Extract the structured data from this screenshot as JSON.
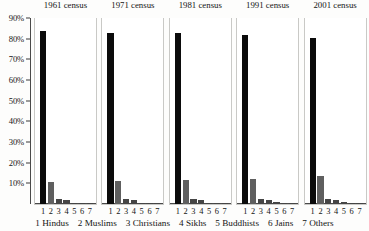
{
  "chart_data": {
    "type": "bar",
    "title": "",
    "xlabel": "",
    "ylabel": "",
    "ylim": [
      0,
      90
    ],
    "grid": false,
    "legend_position": "bottom",
    "y_ticks": [
      "90%",
      "80%",
      "70%",
      "60%",
      "50%",
      "40%",
      "30%",
      "20%",
      "10%"
    ],
    "y_tick_values": [
      90,
      80,
      70,
      60,
      50,
      40,
      30,
      20,
      10
    ],
    "categories": [
      "1 Hindus",
      "2 Muslims",
      "3 Christians",
      "4 Sikhs",
      "5 Buddhists",
      "6 Jains",
      "7 Others"
    ],
    "category_numbers": [
      "1",
      "2",
      "3",
      "4",
      "5",
      "6",
      "7"
    ],
    "groups": [
      "1961 census",
      "1971 census",
      "1981 census",
      "1991 census",
      "2001 census"
    ],
    "series": [
      {
        "name": "1961 census",
        "values": [
          83.5,
          10.7,
          2.4,
          1.8,
          0.7,
          0.5,
          0.4
        ]
      },
      {
        "name": "1971 census",
        "values": [
          82.7,
          11.2,
          2.6,
          1.9,
          0.7,
          0.5,
          0.4
        ]
      },
      {
        "name": "1981 census",
        "values": [
          82.6,
          11.4,
          2.4,
          2.0,
          0.7,
          0.5,
          0.4
        ]
      },
      {
        "name": "1991 census",
        "values": [
          82.0,
          12.1,
          2.3,
          1.9,
          0.8,
          0.4,
          0.4
        ]
      },
      {
        "name": "2001 census",
        "values": [
          80.5,
          13.4,
          2.3,
          1.9,
          0.8,
          0.4,
          0.6
        ]
      }
    ],
    "legend_entries": [
      "1 Hindus",
      "2 Muslims",
      "3 Christians",
      "4 Sikhs",
      "5 Buddhists",
      "6 Jains",
      "7 Others"
    ]
  }
}
